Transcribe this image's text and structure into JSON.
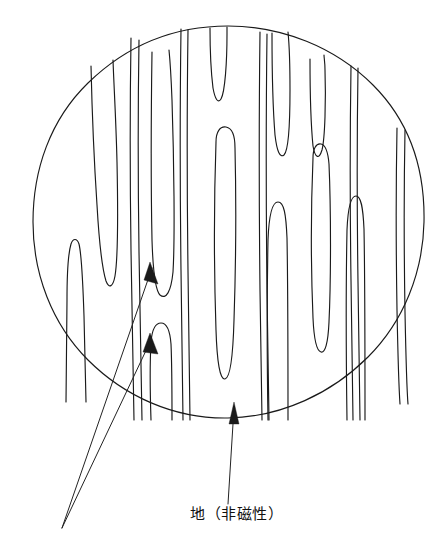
{
  "figure": {
    "kind": "magnified-circular-view",
    "title_text": "",
    "background_color": "#ffffff",
    "line_color": "#1a1a1a",
    "circle": {
      "name": "magnified-field-circle",
      "center_x": 228,
      "center_y": 222,
      "radius": 196
    },
    "annotations": {
      "base_label": {
        "text": "地（非磁性）",
        "x": 190,
        "y": 506,
        "pointer_from": [
          231,
          515
        ],
        "pointer_to": [
          235,
          405
        ]
      },
      "converging_pointer_origin": [
        62,
        528
      ],
      "pointer_targets": [
        [
          156,
          264
        ],
        [
          155,
          334
        ]
      ]
    },
    "stripes": [
      {
        "name": "stripe-1",
        "x": 71,
        "top_y": 241,
        "bottom_y": 400,
        "width": 13,
        "open": "bottom"
      },
      {
        "name": "stripe-2",
        "x": 98,
        "top_y": 63,
        "bottom_y": 285,
        "width": 19,
        "open": "top"
      },
      {
        "name": "stripe-3",
        "x": 133,
        "top_y": 38,
        "bottom_y": 420,
        "width": 7,
        "open": "both"
      },
      {
        "name": "stripe-4",
        "x": 159,
        "top_y": 52,
        "bottom_y": 300,
        "width": 15,
        "open": "top"
      },
      {
        "name": "stripe-5",
        "x": 158,
        "top_y": 325,
        "bottom_y": 420,
        "width": 15,
        "open": "bottom"
      },
      {
        "name": "stripe-6",
        "x": 183,
        "top_y": 29,
        "bottom_y": 420,
        "width": 5,
        "open": "both"
      },
      {
        "name": "stripe-7",
        "x": 216,
        "top_y": 27,
        "bottom_y": 103,
        "width": 17,
        "open": "top"
      },
      {
        "name": "stripe-8",
        "x": 222,
        "top_y": 128,
        "bottom_y": 380,
        "width": 17,
        "open": "none"
      },
      {
        "name": "stripe-9",
        "x": 262,
        "top_y": 32,
        "bottom_y": 420,
        "width": 6,
        "open": "both"
      },
      {
        "name": "stripe-10",
        "x": 277,
        "top_y": 33,
        "bottom_y": 160,
        "width": 15,
        "open": "top"
      },
      {
        "name": "stripe-11",
        "x": 272,
        "top_y": 200,
        "bottom_y": 420,
        "width": 14,
        "open": "bottom"
      },
      {
        "name": "stripe-12",
        "x": 316,
        "top_y": 58,
        "bottom_y": 160,
        "width": 13,
        "open": "top"
      },
      {
        "name": "stripe-13",
        "x": 318,
        "top_y": 143,
        "bottom_y": 350,
        "width": 13,
        "open": "none"
      },
      {
        "name": "stripe-14",
        "x": 353,
        "top_y": 65,
        "bottom_y": 420,
        "width": 6,
        "open": "both"
      },
      {
        "name": "stripe-15",
        "x": 352,
        "top_y": 195,
        "bottom_y": 420,
        "width": 12,
        "open": "bottom"
      },
      {
        "name": "stripe-16",
        "x": 400,
        "top_y": 125,
        "bottom_y": 400,
        "width": 9,
        "open": "both"
      }
    ]
  }
}
